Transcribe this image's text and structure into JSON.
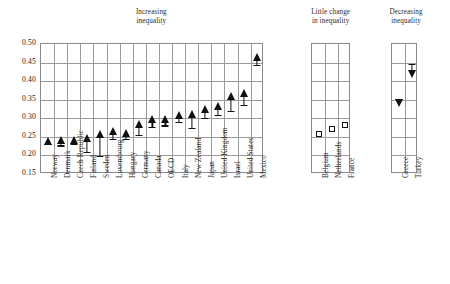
{
  "chart_data": {
    "type": "scatter",
    "title": "",
    "xlabel": "",
    "ylabel": "",
    "ylim": [
      0.15,
      0.5
    ],
    "ytick_labels": [
      "0.50",
      "0.45",
      "0.40",
      "0.35",
      "0.30",
      "0.25",
      "0.20",
      "0.15"
    ],
    "ytick_values": [
      0.5,
      0.45,
      0.4,
      0.35,
      0.3,
      0.25,
      0.2,
      0.15
    ],
    "grid": true,
    "legend": "none",
    "value_meaning": "Gini coefficient of income inequality; arrow tail = earlier value, arrow head = later value",
    "panels": [
      {
        "id": "increasing",
        "title": "Increasing\ninequality",
        "title_line1": "Increasing",
        "title_line2": "inequality",
        "marker": "arrow-up",
        "categories": [
          "Norway",
          "Denmark",
          "Czech Republic",
          "Finland",
          "Sweden",
          "Luxembourg",
          "Hungary",
          "Germany",
          "Canada",
          "OECD",
          "Italy",
          "New Zealand",
          "Japan",
          "United Kingdom",
          "Israel",
          "United States",
          "Mexico"
        ],
        "series": [
          {
            "name": "start",
            "values": [
              0.232,
              0.227,
              0.232,
              0.21,
              0.199,
              0.245,
              0.244,
              0.255,
              0.277,
              0.281,
              0.29,
              0.275,
              0.3,
              0.31,
              0.32,
              0.337,
              0.444
            ]
          },
          {
            "name": "end",
            "values": [
              0.25,
              0.252,
              0.253,
              0.259,
              0.269,
              0.276,
              0.272,
              0.295,
              0.308,
              0.31,
              0.32,
              0.322,
              0.336,
              0.345,
              0.37,
              0.38,
              0.476
            ]
          }
        ]
      },
      {
        "id": "little-change",
        "title": "Little change\nin inequality",
        "title_line1": "Little change",
        "title_line2": "in inequality",
        "marker": "square",
        "categories": [
          "Belgium",
          "Netherlands",
          "France"
        ],
        "series": [
          {
            "name": "value",
            "values": [
              0.259,
              0.271,
              0.281
            ]
          }
        ]
      },
      {
        "id": "decreasing",
        "title": "Decreasing\ninequality",
        "title_line1": "Decreasing",
        "title_line2": "inequality",
        "marker": "arrow-down",
        "categories": [
          "Greece",
          "Turkey"
        ],
        "series": [
          {
            "name": "start",
            "values": [
              0.352,
              0.447
            ]
          },
          {
            "name": "end",
            "values": [
              0.33,
              0.409
            ]
          }
        ]
      }
    ]
  }
}
